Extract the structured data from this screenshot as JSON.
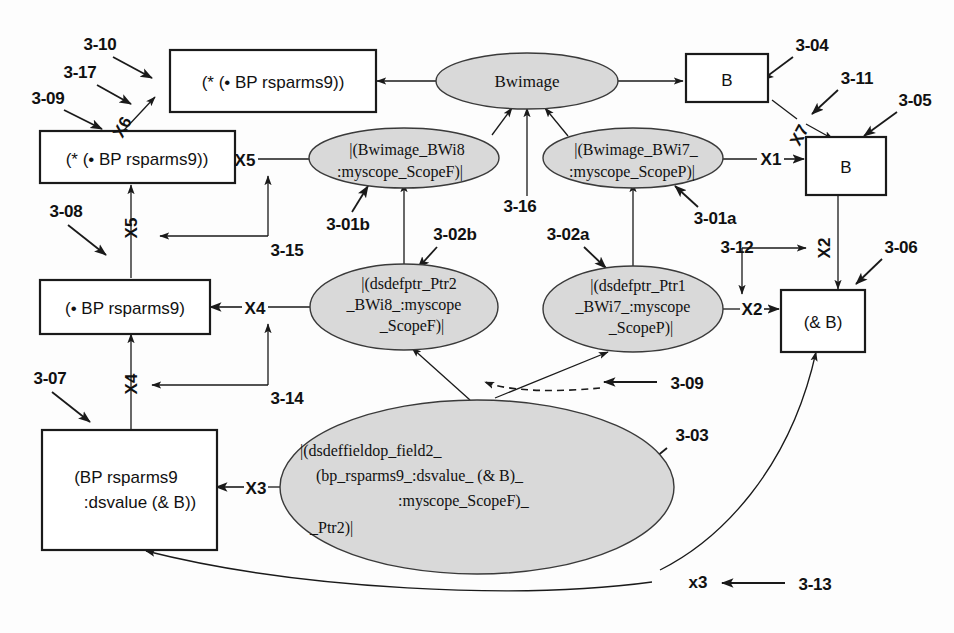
{
  "diagram": {
    "colors": {
      "ellipse_fill": "#d9d9d9",
      "box_fill": "#ffffff",
      "stroke": "#1a1a1a",
      "background": "#fdfdfd"
    },
    "boxes": [
      {
        "id": "box_top_star",
        "lines": [
          "(* (• BP rsparms9))"
        ]
      },
      {
        "id": "box_left_star",
        "lines": [
          "(* (• BP rsparms9))"
        ]
      },
      {
        "id": "box_left_dot",
        "lines": [
          "(• BP rsparms9)"
        ]
      },
      {
        "id": "box_left_bp",
        "lines": [
          "(BP rsparms9",
          ":dsvalue (& B))"
        ]
      },
      {
        "id": "box_b_top",
        "lines": [
          "B"
        ]
      },
      {
        "id": "box_b_mid",
        "lines": [
          "B"
        ]
      },
      {
        "id": "box_and_b",
        "lines": [
          "(& B)"
        ]
      }
    ],
    "ellipses": [
      {
        "id": "ell_bwimage",
        "lines": [
          "Bwimage"
        ]
      },
      {
        "id": "ell_bwi8",
        "lines": [
          "|(Bwimage_BWi8",
          ":myscope_ScopeF)|"
        ]
      },
      {
        "id": "ell_bwi7",
        "lines": [
          "|(Bwimage_BWi7_",
          ":myscope_ScopeP)|"
        ]
      },
      {
        "id": "ell_ptr2",
        "lines": [
          "|(dsdefptr_Ptr2",
          "_BWi8_:myscope",
          "_ScopeF)|"
        ]
      },
      {
        "id": "ell_ptr1",
        "lines": [
          "|(dsdefptr_Ptr1",
          "_BWi7_:myscope",
          "_ScopeP)|"
        ]
      },
      {
        "id": "ell_field2",
        "lines": [
          "|(dsdeffieldop_field2_",
          "(bp_rsparms9_:dsvalue_ (& B)_",
          ":myscope_ScopeF)_",
          "_Ptr2)|"
        ]
      }
    ],
    "port_labels": [
      {
        "id": "port_x1",
        "text": "X1"
      },
      {
        "id": "port_x2_top",
        "text": "X2"
      },
      {
        "id": "port_x2_left",
        "text": "X2"
      },
      {
        "id": "port_x3",
        "text": "X3"
      },
      {
        "id": "port_x3_bottom",
        "text": "x3"
      },
      {
        "id": "port_x4_right",
        "text": "X4"
      },
      {
        "id": "port_x4_below",
        "text": "X4"
      },
      {
        "id": "port_x5_right",
        "text": "X5"
      },
      {
        "id": "port_x5_below",
        "text": "X5"
      },
      {
        "id": "port_x6",
        "text": "X6"
      },
      {
        "id": "port_x7",
        "text": "X7"
      }
    ],
    "annotations": [
      {
        "id": "ann_3_10",
        "text": "3-10"
      },
      {
        "id": "ann_3_17",
        "text": "3-17"
      },
      {
        "id": "ann_3_09_left",
        "text": "3-09"
      },
      {
        "id": "ann_3_08",
        "text": "3-08"
      },
      {
        "id": "ann_3_07",
        "text": "3-07"
      },
      {
        "id": "ann_3_15",
        "text": "3-15"
      },
      {
        "id": "ann_3_14",
        "text": "3-14"
      },
      {
        "id": "ann_3_01b",
        "text": "3-01b"
      },
      {
        "id": "ann_3_02b",
        "text": "3-02b"
      },
      {
        "id": "ann_3_16",
        "text": "3-16"
      },
      {
        "id": "ann_3_02a",
        "text": "3-02a"
      },
      {
        "id": "ann_3_01a",
        "text": "3-01a"
      },
      {
        "id": "ann_3_04",
        "text": "3-04"
      },
      {
        "id": "ann_3_11",
        "text": "3-11"
      },
      {
        "id": "ann_3_05",
        "text": "3-05"
      },
      {
        "id": "ann_3_12",
        "text": "3-12"
      },
      {
        "id": "ann_3_06",
        "text": "3-06"
      },
      {
        "id": "ann_3_09_mid",
        "text": "3-09"
      },
      {
        "id": "ann_3_03",
        "text": "3-03"
      },
      {
        "id": "ann_3_13",
        "text": "3-13"
      }
    ]
  }
}
